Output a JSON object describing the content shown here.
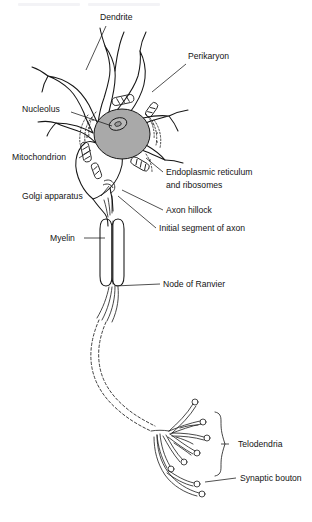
{
  "figure": {
    "kind": "labeled-anatomical-diagram",
    "background_color": "#ffffff",
    "ink_color": "#161616",
    "nucleus_fill": "#a9a9a9",
    "nucleolus_fill": "#bdbdbd"
  },
  "header": {
    "visible_fragment": "",
    "note": "faint cropped page header remnant at very top edge"
  },
  "labels": {
    "dendrite": "Dendrite",
    "perikaryon": "Perikaryon",
    "nucleolus": "Nucleolus",
    "mitochondrion": "Mitochondrion",
    "golgi_apparatus": "Golgi apparatus",
    "endoplasmic_reticulum_line1": "Endoplasmic reticulum",
    "endoplasmic_reticulum_line2": "and ribosomes",
    "axon_hillock": "Axon hillock",
    "initial_segment_of_axon": "Initial segment of axon",
    "myelin": "Myelin",
    "node_of_ranvier": "Node of Ranvier",
    "telodendria": "Telodendria",
    "synaptic_bouton": "Synaptic bouton"
  },
  "label_positions": {
    "dendrite": {
      "x": 100,
      "y": 20
    },
    "perikaryon": {
      "x": 188,
      "y": 59
    },
    "nucleolus": {
      "x": 22,
      "y": 112
    },
    "mitochondrion": {
      "x": 12,
      "y": 160
    },
    "golgi_apparatus": {
      "x": 22,
      "y": 199
    },
    "endoplasmic_reticulum": {
      "x": 166,
      "y": 175
    },
    "axon_hillock": {
      "x": 166,
      "y": 213
    },
    "initial_segment_of_axon": {
      "x": 159,
      "y": 231
    },
    "myelin": {
      "x": 50,
      "y": 241
    },
    "node_of_ranvier": {
      "x": 163,
      "y": 287
    },
    "telodendria": {
      "x": 238,
      "y": 447
    },
    "synaptic_bouton": {
      "x": 240,
      "y": 481
    }
  }
}
